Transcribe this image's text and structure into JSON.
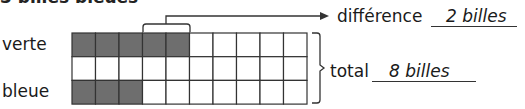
{
  "heading": "3 billes bleues",
  "rows": [
    {
      "label": "verte",
      "shaded": 5
    },
    {
      "label": "",
      "shaded": 0
    },
    {
      "label": "bleue",
      "shaded": 3
    }
  ],
  "grid": {
    "columns": 10,
    "fill_color": "#6e6e6e",
    "line_color": "#333333"
  },
  "difference": {
    "label": "différence",
    "value": "2 billes"
  },
  "total": {
    "label": "total",
    "value": "8 billes"
  }
}
